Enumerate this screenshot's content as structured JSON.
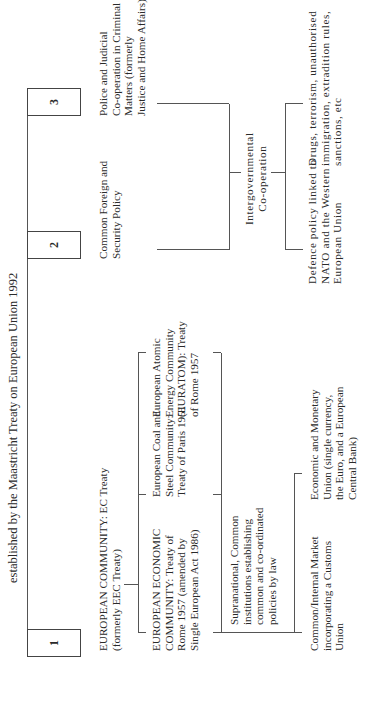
{
  "title": "established by the Maastricht Treaty on European Union 1992",
  "pillars": [
    {
      "number": "1",
      "label": "EUROPEAN COMMUNITY: EC Treaty\n(formerly EEC Treaty)"
    },
    {
      "number": "2",
      "label": "Common Foreign and\nSecurity Policy"
    },
    {
      "number": "3",
      "label": "Police and Judicial\nCo-operation in Criminal\nMatters (formerly\nJustice and Home Affairs)"
    }
  ],
  "pillar1_components": [
    {
      "label": "EUROPEAN ECONOMIC\nCOMMUNITY: Treaty of\nRome 1957 (amended by\nSingle European Act 1986)"
    },
    {
      "label": "European Coal and\nSteel Community:\nTreaty of Paris 1951"
    },
    {
      "label": "European Atomic\nEnergy Community\n(EURATOM): Treaty\nof Rome 1957"
    }
  ],
  "supranational": "Supranational, Common\ninstitutions establishing\ncommon and co-ordinated\npolicies by law",
  "pillar1_outcomes": [
    {
      "label": "Common/Internal Market\nincorporating a Customs\nUnion"
    },
    {
      "label": "Economic and Monetary\nUnion (single currency,\nthe Euro, and a European\nCentral Bank)"
    }
  ],
  "intergovernmental": "Intergovernmental\nCo-operation",
  "pillar2_outcome": "Defence policy linked to\nNATO and the Western\nEuropean Union",
  "pillar3_outcome": "Drugs, terrorism, unauthorised\nimmigration, extradition rules,\nsanctions, etc"
}
